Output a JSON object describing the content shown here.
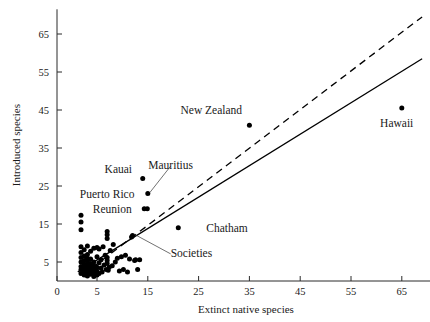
{
  "chart_data": {
    "type": "scatter",
    "title": "",
    "xlabel": "Extinct native species",
    "ylabel": "Introduced species",
    "xlim": [
      0,
      70
    ],
    "ylim": [
      0,
      70
    ],
    "xticks": [
      0,
      5,
      15,
      25,
      35,
      45,
      55,
      65
    ],
    "yticks": [
      5,
      15,
      25,
      35,
      45,
      55,
      65
    ],
    "grid": false,
    "legend": "none",
    "axis_note": "x tick at 0 is drawn at the axis origin; the 5 tick follows, then 10-unit steps",
    "series": [
      {
        "name": "islands",
        "marker": "filled-circle",
        "color": "#000000",
        "points": [
          [
            3.0,
            2.0
          ],
          [
            3.0,
            3.0
          ],
          [
            3.0,
            3.8
          ],
          [
            3.0,
            5.0
          ],
          [
            3.0,
            6.2
          ],
          [
            3.0,
            7.5
          ],
          [
            3.0,
            9.0
          ],
          [
            3.0,
            13.5
          ],
          [
            3.0,
            15.5
          ],
          [
            3.0,
            17.3
          ],
          [
            3.4,
            1.6
          ],
          [
            3.4,
            2.6
          ],
          [
            3.4,
            3.4
          ],
          [
            3.4,
            4.4
          ],
          [
            3.4,
            5.4
          ],
          [
            3.4,
            6.6
          ],
          [
            3.4,
            8.2
          ],
          [
            3.8,
            1.3
          ],
          [
            3.8,
            2.3
          ],
          [
            3.8,
            3.2
          ],
          [
            3.8,
            4.2
          ],
          [
            3.8,
            5.2
          ],
          [
            3.8,
            6.0
          ],
          [
            3.8,
            7.0
          ],
          [
            3.8,
            9.2
          ],
          [
            4.2,
            1.8
          ],
          [
            4.2,
            2.8
          ],
          [
            4.2,
            3.6
          ],
          [
            4.2,
            4.6
          ],
          [
            4.2,
            5.8
          ],
          [
            4.2,
            7.8
          ],
          [
            4.6,
            1.2
          ],
          [
            4.6,
            2.2
          ],
          [
            4.6,
            3.0
          ],
          [
            4.6,
            4.0
          ],
          [
            4.6,
            5.0
          ],
          [
            4.6,
            8.6
          ],
          [
            5.0,
            1.6
          ],
          [
            5.0,
            2.6
          ],
          [
            5.0,
            3.6
          ],
          [
            5.0,
            6.4
          ],
          [
            5.0,
            8.8
          ],
          [
            5.4,
            2.0
          ],
          [
            5.4,
            4.8
          ],
          [
            5.4,
            8.4
          ],
          [
            5.8,
            3.4
          ],
          [
            5.8,
            5.6
          ],
          [
            6.0,
            2.4
          ],
          [
            6.2,
            9.0
          ],
          [
            6.4,
            4.2
          ],
          [
            6.6,
            6.8
          ],
          [
            6.8,
            3.0
          ],
          [
            7.0,
            11.2
          ],
          [
            7.0,
            12.2
          ],
          [
            7.0,
            13.0
          ],
          [
            7.0,
            4.6
          ],
          [
            7.0,
            5.4
          ],
          [
            7.0,
            6.2
          ],
          [
            7.2,
            2.8
          ],
          [
            7.4,
            3.6
          ],
          [
            7.6,
            8.0
          ],
          [
            8.0,
            4.0
          ],
          [
            8.2,
            9.6
          ],
          [
            8.6,
            5.0
          ],
          [
            9.0,
            6.0
          ],
          [
            9.4,
            2.6
          ],
          [
            9.8,
            6.4
          ],
          [
            10.2,
            3.0
          ],
          [
            10.6,
            6.8
          ],
          [
            11.0,
            2.4
          ],
          [
            11.4,
            5.8
          ],
          [
            11.8,
            11.6
          ],
          [
            12.0,
            12.0
          ],
          [
            12.4,
            5.4
          ],
          [
            12.6,
            5.6
          ],
          [
            13.0,
            3.0
          ],
          [
            13.4,
            5.6
          ],
          [
            14.0,
            27.0
          ],
          [
            15.0,
            23.0
          ],
          [
            14.3,
            19.0
          ],
          [
            14.9,
            19.0
          ],
          [
            21.0,
            14.0
          ],
          [
            35.0,
            41.0
          ],
          [
            65.0,
            45.5
          ]
        ]
      }
    ],
    "lines": [
      {
        "name": "solid-fit-line",
        "style": "solid",
        "from": [
          2.6,
          2.4
        ],
        "to": [
          69.0,
          58.5
        ]
      },
      {
        "name": "dashed-fit-line",
        "style": "dashed",
        "from": [
          3.2,
          1.6
        ],
        "to": [
          69.0,
          69.5
        ]
      }
    ],
    "annotations": [
      {
        "id": "new-zealand",
        "label": "New Zealand",
        "text_xy": [
          27.5,
          45.0
        ],
        "point_xy": [
          35.0,
          41.0
        ],
        "leader": false,
        "anchor": "middle"
      },
      {
        "id": "hawaii",
        "label": "Hawaii",
        "text_xy": [
          64.0,
          41.5
        ],
        "point_xy": [
          65.0,
          45.5
        ],
        "leader": false,
        "anchor": "middle"
      },
      {
        "id": "kauai",
        "label": "Kauai",
        "text_xy": [
          9.2,
          29.5
        ],
        "point_xy": [
          14.0,
          27.0
        ],
        "leader": false,
        "anchor": "middle"
      },
      {
        "id": "mauritius",
        "label": "Mauritius",
        "text_xy": [
          19.5,
          30.5
        ],
        "point_xy": [
          15.0,
          23.0
        ],
        "leader": true,
        "anchor": "middle"
      },
      {
        "id": "puerto-rico",
        "label": "Puerto Rico",
        "text_xy": [
          7.0,
          23.0
        ],
        "point_xy": [
          15.0,
          23.0
        ],
        "leader": false,
        "anchor": "middle"
      },
      {
        "id": "reunion",
        "label": "Reunion",
        "text_xy": [
          8.0,
          19.0
        ],
        "point_xy": [
          14.3,
          19.0
        ],
        "leader": false,
        "anchor": "middle"
      },
      {
        "id": "chatham",
        "label": "Chatham",
        "text_xy": [
          26.5,
          14.0
        ],
        "point_xy": [
          21.0,
          14.0
        ],
        "leader": false,
        "anchor": "start"
      },
      {
        "id": "societies",
        "label": "Societies",
        "text_xy": [
          19.5,
          7.4
        ],
        "point_xy": [
          12.0,
          12.0
        ],
        "leader": true,
        "anchor": "start"
      }
    ]
  }
}
